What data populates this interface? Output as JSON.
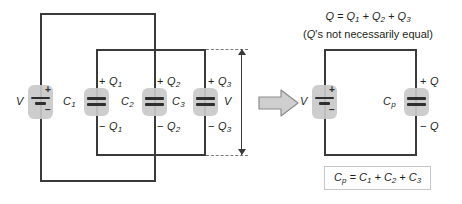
{
  "figure": {
    "left_circuit": {
      "source_label": "V",
      "source_plus": "+",
      "source_minus": "−",
      "voltage_bracket_label": "V",
      "capacitors": [
        {
          "name": "C",
          "sub": "1",
          "charge_top": "+ Q",
          "charge_top_sub": "1",
          "charge_bottom": "− Q",
          "charge_bottom_sub": "1"
        },
        {
          "name": "C",
          "sub": "2",
          "charge_top": "+ Q",
          "charge_top_sub": "2",
          "charge_bottom": "− Q",
          "charge_bottom_sub": "2"
        },
        {
          "name": "C",
          "sub": "3",
          "charge_top": "+ Q",
          "charge_top_sub": "3",
          "charge_bottom": "− Q",
          "charge_bottom_sub": "3"
        }
      ]
    },
    "transform_arrow": "equivalent-to-arrow",
    "right_circuit": {
      "source_label": "V",
      "source_plus": "+",
      "source_minus": "−",
      "capacitor_name": "C",
      "capacitor_sub": "p",
      "charge_top": "+ Q",
      "charge_bottom": "− Q"
    },
    "equations": {
      "charge_sum_line1_lhs": "Q",
      "charge_sum_line1_rhs": "= Q₁ + Q₂ + Q₃",
      "charge_sum_line2": "(Q's not necessarily equal)",
      "capacitance_formula": "Cₚ = C₁ + C₂ + C₃"
    },
    "colors": {
      "wire": "#3a3a3a",
      "plate": "#2e2e2e",
      "highlight": "#c9c9c9",
      "dashed": "#7a7a7a",
      "text": "#231f20",
      "box_border": "#c6c6c6",
      "background": "#ffffff"
    }
  }
}
